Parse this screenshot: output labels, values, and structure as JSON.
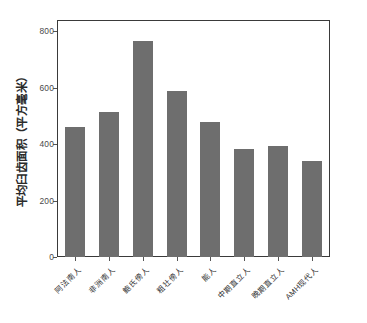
{
  "chart_data": {
    "type": "bar",
    "title": "",
    "subtitle": "",
    "xlabel": "",
    "ylabel": "平均臼齿面积（平方毫米）",
    "categories": [
      "阿法南人",
      "非洲南人",
      "鲍氏傍人",
      "粗壮傍人",
      "能人",
      "中期直立人",
      "晚期直立人",
      "AMH现代人"
    ],
    "values": [
      460,
      515,
      765,
      590,
      480,
      382,
      393,
      340
    ],
    "ylim": [
      0,
      840
    ],
    "yticks": [
      0,
      200,
      400,
      600,
      800
    ],
    "ytick_labels": [
      "0",
      "200",
      "400",
      "600",
      "800"
    ],
    "grid": false,
    "legend": "none",
    "bar_color": "#6e6e6e",
    "axis_color": "#3a3a3a",
    "background": "#ffffff"
  },
  "axis": {
    "y_title": "平均臼齿面积（平方毫米）"
  }
}
